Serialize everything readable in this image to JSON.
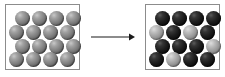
{
  "diagram": {
    "type": "before-after-transformation",
    "background_color": "#ffffff",
    "panel_border_color": "#8c8c8c",
    "arrow": {
      "name": "transformation-arrow",
      "direction": "right",
      "label": "",
      "color": "#1a1a1a",
      "x": 91,
      "y": 37,
      "length": 44
    },
    "colors": {
      "gray": "#7e7e7e",
      "dark": "#1c1c1c",
      "light": "#a8a8a8"
    },
    "panels": [
      {
        "name": "panel-before",
        "label": "",
        "x": 5,
        "y": 4,
        "width": 75,
        "height": 66,
        "rows": 4,
        "columns": 4,
        "sphere_count": 16,
        "sphere_diameter": 15,
        "legend": "all spheres identical gray",
        "grid": [
          [
            "gray",
            "gray",
            "gray",
            "gray"
          ],
          [
            "gray",
            "gray",
            "gray",
            "gray"
          ],
          [
            "gray",
            "gray",
            "gray",
            "gray"
          ],
          [
            "gray",
            "gray",
            "gray",
            "gray"
          ]
        ],
        "row_offsets": [
          9,
          3,
          9,
          3
        ],
        "row_tops": [
          6,
          20,
          34,
          47
        ],
        "counts": {
          "gray": 16,
          "dark": 0,
          "light": 0
        }
      },
      {
        "name": "panel-after",
        "label": "",
        "x": 145,
        "y": 4,
        "width": 75,
        "height": 66,
        "rows": 4,
        "columns": 4,
        "sphere_count": 16,
        "sphere_diameter": 15,
        "legend": "mixture of dark and light spheres",
        "grid": [
          [
            "dark",
            "dark",
            "dark",
            "dark"
          ],
          [
            "light",
            "dark",
            "light",
            "dark"
          ],
          [
            "dark",
            "dark",
            "dark",
            "light"
          ],
          [
            "dark",
            "light",
            "dark",
            "dark"
          ]
        ],
        "row_offsets": [
          9,
          3,
          9,
          3
        ],
        "row_tops": [
          6,
          20,
          34,
          47
        ],
        "counts": {
          "gray": 0,
          "dark": 12,
          "light": 4
        }
      }
    ]
  }
}
